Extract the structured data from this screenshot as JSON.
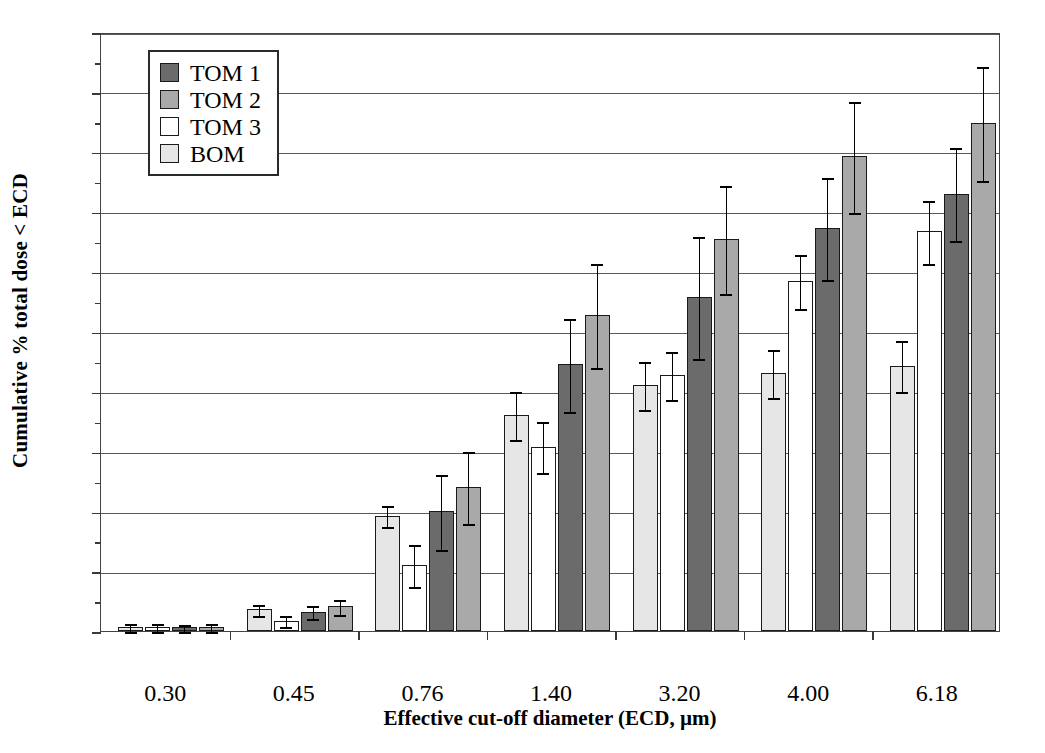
{
  "chart_data": {
    "type": "bar",
    "title": "",
    "xlabel": "Effective cut-off diameter (ECD, µm)",
    "ylabel": "Cumulative % total dose < ECD",
    "categories": [
      "0.30",
      "0.45",
      "0.76",
      "1.40",
      "3.20",
      "4.00",
      "6.18"
    ],
    "ylim": [
      0,
      20
    ],
    "ytick_labels": [
      "0",
      "2",
      "4",
      "6",
      "8",
      "10",
      "12",
      "14",
      "16",
      "18",
      "20"
    ],
    "ytick_values": [
      0,
      2,
      4,
      6,
      8,
      10,
      12,
      14,
      16,
      18,
      20
    ],
    "yminor_values": [
      1,
      3,
      5,
      7,
      9,
      11,
      13,
      15,
      17,
      19
    ],
    "grid": "horizontal",
    "legend_position": "upper-left",
    "error_bars": "yes",
    "series_draw_order": [
      "BOM",
      "TOM 3",
      "TOM 1",
      "TOM 2"
    ],
    "series": [
      {
        "name": "TOM 1",
        "color": "#6b6b6b",
        "values": [
          0.13,
          0.65,
          4.0,
          8.9,
          11.15,
          13.45,
          14.6
        ],
        "errors": [
          0.12,
          0.22,
          1.25,
          1.55,
          2.05,
          1.7,
          1.55
        ]
      },
      {
        "name": "TOM 2",
        "color": "#a9a9a9",
        "values": [
          0.13,
          0.82,
          4.8,
          10.55,
          13.1,
          15.85,
          16.95
        ],
        "errors": [
          0.14,
          0.25,
          1.2,
          1.75,
          1.8,
          1.85,
          1.9
        ]
      },
      {
        "name": "TOM 3",
        "color": "#ffffff",
        "values": [
          0.12,
          0.35,
          2.2,
          6.15,
          8.55,
          11.7,
          13.35
        ],
        "errors": [
          0.16,
          0.18,
          0.7,
          0.85,
          0.8,
          0.9,
          1.05
        ]
      },
      {
        "name": "BOM",
        "color": "#e6e6e6",
        "values": [
          0.13,
          0.72,
          3.85,
          7.2,
          8.2,
          8.6,
          8.85
        ],
        "errors": [
          0.13,
          0.18,
          0.35,
          0.8,
          0.8,
          0.8,
          0.85
        ]
      }
    ]
  },
  "legend": {
    "items": [
      {
        "label": "TOM 1",
        "color": "#6b6b6b"
      },
      {
        "label": "TOM 2",
        "color": "#a9a9a9"
      },
      {
        "label": "TOM 3",
        "color": "#ffffff"
      },
      {
        "label": "BOM",
        "color": "#e6e6e6"
      }
    ]
  }
}
